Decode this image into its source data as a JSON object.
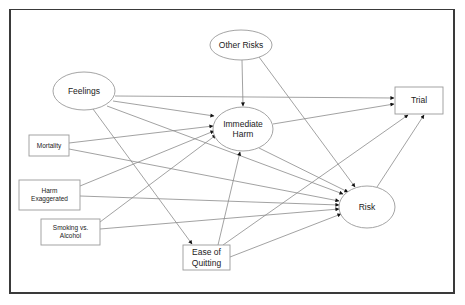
{
  "diagram": {
    "type": "path-diagram",
    "nodes": [
      {
        "id": "other_risks",
        "shape": "ellipse",
        "lines": [
          "Other Risks"
        ],
        "cx": 241,
        "cy": 45,
        "rx": 31,
        "ry": 15,
        "font": 8.5
      },
      {
        "id": "feelings",
        "shape": "ellipse",
        "lines": [
          "Feelings"
        ],
        "cx": 84,
        "cy": 91,
        "rx": 31,
        "ry": 19,
        "font": 8.5
      },
      {
        "id": "immediate_harm",
        "shape": "ellipse",
        "lines": [
          "Immediate",
          "Harm"
        ],
        "cx": 243,
        "cy": 129,
        "rx": 30,
        "ry": 22,
        "font": 8.5
      },
      {
        "id": "trial",
        "shape": "rect",
        "lines": [
          "Trial"
        ],
        "x": 395,
        "y": 87,
        "w": 48,
        "h": 27,
        "font": 8.5
      },
      {
        "id": "mortality",
        "shape": "rect",
        "lines": [
          "Mortality"
        ],
        "x": 29,
        "y": 135,
        "w": 40,
        "h": 21,
        "font": 6.5
      },
      {
        "id": "harm_exaggerated",
        "shape": "rect",
        "lines": [
          "Harm",
          "Exaggerated"
        ],
        "x": 19,
        "y": 180,
        "w": 61,
        "h": 30,
        "font": 6.5
      },
      {
        "id": "smoking_vs_alcohol",
        "shape": "rect",
        "lines": [
          "Smoking vs.",
          "Alcohol"
        ],
        "x": 41,
        "y": 219,
        "w": 59,
        "h": 26,
        "font": 6.5
      },
      {
        "id": "ease_of_quitting",
        "shape": "rect",
        "lines": [
          "Ease of",
          "Quitting"
        ],
        "x": 183,
        "y": 245,
        "w": 47,
        "h": 25,
        "font": 8.5
      },
      {
        "id": "risk",
        "shape": "ellipse",
        "lines": [
          "Risk"
        ],
        "cx": 367,
        "cy": 207,
        "rx": 28,
        "ry": 21,
        "font": 8.5
      }
    ],
    "edges": [
      {
        "from": "other_risks",
        "to": "immediate_harm",
        "x1": 242,
        "y1": 60,
        "x2": 243,
        "y2": 106
      },
      {
        "from": "other_risks",
        "to": "risk",
        "x1": 259,
        "y1": 57,
        "x2": 355,
        "y2": 187
      },
      {
        "from": "feelings",
        "to": "trial",
        "x1": 115,
        "y1": 96,
        "x2": 394,
        "y2": 98
      },
      {
        "from": "feelings",
        "to": "immediate_harm",
        "x1": 113,
        "y1": 101,
        "x2": 214,
        "y2": 116
      },
      {
        "from": "feelings",
        "to": "risk",
        "x1": 107,
        "y1": 106,
        "x2": 343,
        "y2": 194
      },
      {
        "from": "feelings",
        "to": "ease_of_quitting",
        "x1": 93,
        "y1": 109,
        "x2": 192,
        "y2": 244
      },
      {
        "from": "immediate_harm",
        "to": "trial",
        "x1": 273,
        "y1": 124,
        "x2": 394,
        "y2": 104
      },
      {
        "from": "immediate_harm",
        "to": "risk",
        "x1": 259,
        "y1": 148,
        "x2": 348,
        "y2": 192
      },
      {
        "from": "mortality",
        "to": "immediate_harm",
        "x1": 69,
        "y1": 143,
        "x2": 213,
        "y2": 126
      },
      {
        "from": "mortality",
        "to": "risk",
        "x1": 69,
        "y1": 149,
        "x2": 339,
        "y2": 201
      },
      {
        "from": "harm_exaggerated",
        "to": "immediate_harm",
        "x1": 80,
        "y1": 186,
        "x2": 214,
        "y2": 131
      },
      {
        "from": "harm_exaggerated",
        "to": "risk",
        "x1": 80,
        "y1": 196,
        "x2": 339,
        "y2": 205
      },
      {
        "from": "smoking_vs_alcohol",
        "to": "immediate_harm",
        "x1": 100,
        "y1": 222,
        "x2": 216,
        "y2": 135
      },
      {
        "from": "smoking_vs_alcohol",
        "to": "risk",
        "x1": 100,
        "y1": 229,
        "x2": 339,
        "y2": 209
      },
      {
        "from": "ease_of_quitting",
        "to": "immediate_harm",
        "x1": 218,
        "y1": 245,
        "x2": 240,
        "y2": 152
      },
      {
        "from": "ease_of_quitting",
        "to": "trial",
        "x1": 223,
        "y1": 245,
        "x2": 408,
        "y2": 115
      },
      {
        "from": "ease_of_quitting",
        "to": "risk",
        "x1": 230,
        "y1": 257,
        "x2": 341,
        "y2": 214
      },
      {
        "from": "risk",
        "to": "trial",
        "x1": 377,
        "y1": 187,
        "x2": 424,
        "y2": 115
      }
    ],
    "colors": {
      "frame": "#3a3a3a",
      "edge": "#8a8a8a",
      "arrowhead": "#111111",
      "node_stroke": "#9a9a9a",
      "text": "#222222"
    }
  }
}
